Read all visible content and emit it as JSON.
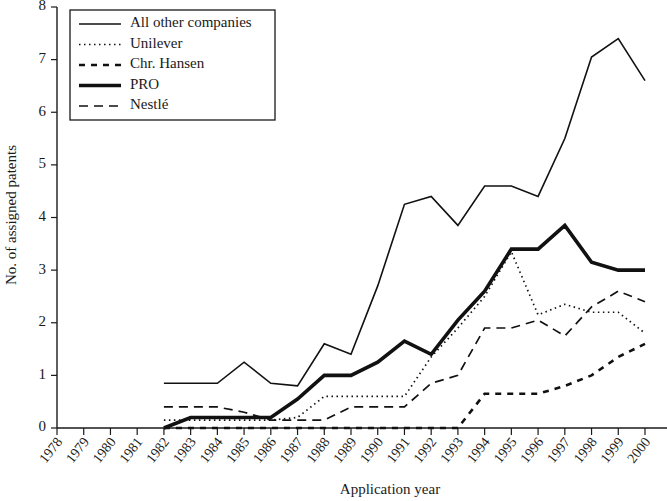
{
  "chart_data": {
    "type": "line",
    "title": "",
    "xlabel": "Application year",
    "ylabel": "No. of assigned patents",
    "xlim": [
      1978,
      2000
    ],
    "ylim": [
      0,
      8
    ],
    "ytick_labels": [
      "0",
      "1",
      "2",
      "3",
      "4",
      "5",
      "6",
      "7",
      "8"
    ],
    "yticks": [
      0,
      1,
      2,
      3,
      4,
      5,
      6,
      7,
      8
    ],
    "grid": false,
    "legend_position": "top-left",
    "x": [
      1978,
      1979,
      1980,
      1981,
      1982,
      1983,
      1984,
      1985,
      1986,
      1987,
      1988,
      1989,
      1990,
      1991,
      1992,
      1993,
      1994,
      1995,
      1996,
      1997,
      1998,
      1999,
      2000
    ],
    "categories": [
      "1978",
      "1979",
      "1980",
      "1981",
      "1982",
      "1983",
      "1984",
      "1985",
      "1986",
      "1987",
      "1988",
      "1989",
      "1990",
      "1991",
      "1992",
      "1993",
      "1994",
      "1995",
      "1996",
      "1997",
      "1998",
      "1999",
      "2000"
    ],
    "series": [
      {
        "name": "All other companies",
        "style": "solid",
        "width": 1.6,
        "dash": "none",
        "x": [
          1982,
          1983,
          1984,
          1985,
          1986,
          1987,
          1988,
          1989,
          1990,
          1991,
          1992,
          1993,
          1994,
          1995,
          1996,
          1997,
          1998,
          1999,
          2000
        ],
        "values": [
          0.85,
          0.85,
          0.85,
          1.25,
          0.85,
          0.8,
          1.6,
          1.4,
          2.7,
          4.25,
          4.4,
          3.85,
          4.6,
          4.6,
          4.4,
          5.5,
          7.05,
          7.4,
          6.6
        ]
      },
      {
        "name": "Unilever",
        "style": "dotted",
        "width": 1.7,
        "dash": "1.5 3.5",
        "x": [
          1982,
          1983,
          1984,
          1985,
          1986,
          1987,
          1988,
          1989,
          1990,
          1991,
          1992,
          1993,
          1994,
          1995,
          1996,
          1997,
          1998,
          1999,
          2000
        ],
        "values": [
          0.15,
          0.15,
          0.15,
          0.15,
          0.15,
          0.2,
          0.6,
          0.6,
          0.6,
          0.6,
          1.35,
          1.9,
          2.5,
          3.35,
          2.15,
          2.35,
          2.2,
          2.2,
          1.8
        ]
      },
      {
        "name": "Chr. Hansen",
        "style": "dashed-short",
        "width": 2.6,
        "dash": "6 6",
        "x": [
          1982,
          1983,
          1984,
          1985,
          1986,
          1987,
          1988,
          1989,
          1990,
          1991,
          1992,
          1993,
          1994,
          1995,
          1996,
          1997,
          1998,
          1999,
          2000
        ],
        "values": [
          0,
          0,
          0,
          0,
          0,
          0,
          0,
          0,
          0,
          0,
          0,
          0,
          0.65,
          0.65,
          0.65,
          0.8,
          1.0,
          1.35,
          1.6
        ]
      },
      {
        "name": "PRO",
        "style": "solid-thick",
        "width": 3.6,
        "dash": "none",
        "x": [
          1982,
          1983,
          1984,
          1985,
          1986,
          1987,
          1988,
          1989,
          1990,
          1991,
          1992,
          1993,
          1994,
          1995,
          1996,
          1997,
          1998,
          1999,
          2000
        ],
        "values": [
          0.0,
          0.2,
          0.2,
          0.2,
          0.2,
          0.55,
          1.0,
          1.0,
          1.25,
          1.65,
          1.4,
          2.05,
          2.6,
          3.4,
          3.4,
          3.85,
          3.15,
          3.0,
          3.0
        ]
      },
      {
        "name": "Nestlé",
        "style": "dashed-long",
        "width": 1.7,
        "dash": "9 6",
        "x": [
          1982,
          1983,
          1984,
          1985,
          1986,
          1987,
          1988,
          1989,
          1990,
          1991,
          1992,
          1993,
          1994,
          1995,
          1996,
          1997,
          1998,
          1999,
          2000
        ],
        "values": [
          0.4,
          0.4,
          0.4,
          0.3,
          0.15,
          0.15,
          0.15,
          0.4,
          0.4,
          0.4,
          0.85,
          1.0,
          1.9,
          1.9,
          2.05,
          1.75,
          2.3,
          2.6,
          2.4
        ]
      }
    ]
  },
  "legend": {
    "items": [
      {
        "label": "All other companies"
      },
      {
        "label": "Unilever"
      },
      {
        "label": "Chr. Hansen"
      },
      {
        "label": "PRO"
      },
      {
        "label": "Nestlé"
      }
    ]
  },
  "colors": {
    "ink": "#111111",
    "background": "#ffffff"
  }
}
